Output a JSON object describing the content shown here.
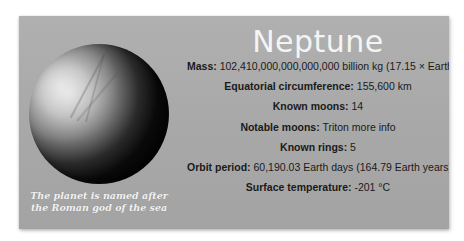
{
  "planet": {
    "name": "Neptune",
    "image_alt": "Neptune planet image",
    "caption_line1": "The planet is named after",
    "caption_line2": "the Roman god of the sea"
  },
  "facts": [
    {
      "label": "Mass:",
      "value": " 102,410,000,000,000,000 billion kg (17.15 × Earth)"
    },
    {
      "label": "Equatorial circumference:",
      "value": " 155,600 km"
    },
    {
      "label": "Known moons:",
      "value": " 14"
    },
    {
      "label": "Notable moons:",
      "value": " Triton ",
      "link": "more info"
    },
    {
      "label": "Known rings:",
      "value": " 5"
    },
    {
      "label": "Orbit period:",
      "value": " 60,190.03 Earth days (164.79 Earth years)"
    },
    {
      "label": "Surface temperature:",
      "value": " -201 °C"
    }
  ],
  "colors": {
    "card_bg": "#a9a9a9",
    "title": "#f4f4f4",
    "text": "#1a1a1a",
    "caption": "#f2f2f2"
  }
}
